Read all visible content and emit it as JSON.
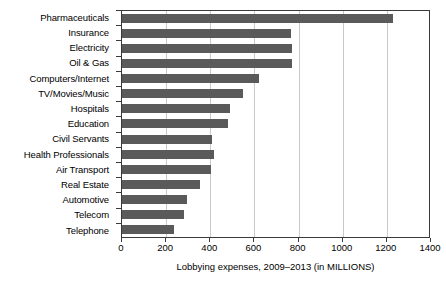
{
  "chart_data": {
    "type": "bar",
    "orientation": "horizontal",
    "title": "",
    "xlabel": "Lobbying expenses, 2009–2013 (in MILLIONS)",
    "ylabel": "",
    "categories": [
      "Pharmaceuticals",
      "Insurance",
      "Electricity",
      "Oil & Gas",
      "Computers/Internet",
      "TV/Movies/Music",
      "Hospitals",
      "Education",
      "Civil Servants",
      "Health Professionals",
      "Air Transport",
      "Real Estate",
      "Automotive",
      "Telecom",
      "Telephone"
    ],
    "values": [
      1230,
      765,
      770,
      770,
      620,
      550,
      490,
      480,
      410,
      415,
      405,
      355,
      295,
      280,
      235
    ],
    "xlim": [
      0,
      1400
    ],
    "xticks": [
      0,
      200,
      400,
      600,
      800,
      1000,
      1200,
      1400
    ],
    "xtick_labels": [
      "0",
      "200",
      "400",
      "600",
      "800",
      "1000",
      "1200",
      "1400"
    ],
    "grid": true,
    "grid_axis": "x",
    "legend": false,
    "bar_color": "#5a5a5a",
    "gridline_color": "#c9c9c9",
    "axis_color": "#3a3a3a"
  }
}
